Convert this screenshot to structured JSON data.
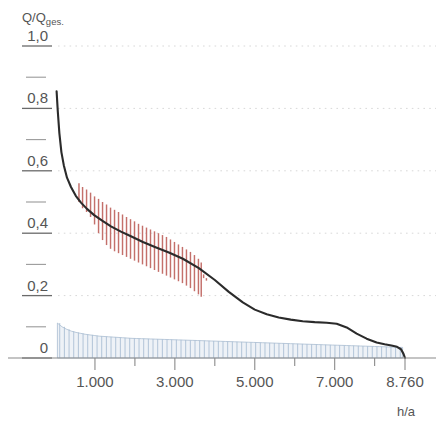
{
  "chart_data": {
    "type": "line",
    "title": "",
    "ylabel": "Q/Qges.",
    "ylabel_main": "Q/Q",
    "ylabel_sub": "ges.",
    "xlabel": "h/a",
    "xlim": [
      0,
      8760
    ],
    "ylim": [
      0,
      1.0
    ],
    "grid": "horizontal-dotted",
    "legend": "none",
    "y_ticks": [
      {
        "value": 1.0,
        "label": "1,0"
      },
      {
        "value": 0.9,
        "label": ""
      },
      {
        "value": 0.8,
        "label": "0,8"
      },
      {
        "value": 0.7,
        "label": ""
      },
      {
        "value": 0.6,
        "label": "0,6"
      },
      {
        "value": 0.5,
        "label": ""
      },
      {
        "value": 0.4,
        "label": "0,4"
      },
      {
        "value": 0.3,
        "label": ""
      },
      {
        "value": 0.2,
        "label": "0,2"
      },
      {
        "value": 0.1,
        "label": ""
      },
      {
        "value": 0.0,
        "label": "0"
      }
    ],
    "x_ticks": [
      {
        "value": 1000,
        "label": "1.000"
      },
      {
        "value": 2000,
        "label": ""
      },
      {
        "value": 3000,
        "label": "3.000"
      },
      {
        "value": 4000,
        "label": ""
      },
      {
        "value": 5000,
        "label": "5.000"
      },
      {
        "value": 6000,
        "label": ""
      },
      {
        "value": 7000,
        "label": ""
      },
      {
        "value": 8000,
        "label": ""
      },
      {
        "value": 8760,
        "label": "8.760"
      }
    ],
    "x_ticks_labeled": [
      "1.000",
      "3.000",
      "5.000",
      "7.000",
      "8.760"
    ],
    "series": [
      {
        "name": "duration-curve",
        "color": "#2b2b2b",
        "x": [
          40,
          70,
          110,
          160,
          220,
          300,
          400,
          520,
          650,
          800,
          980,
          1180,
          1400,
          1650,
          1900,
          2200,
          2500,
          2850,
          3200,
          3600,
          4000,
          4350,
          4700,
          5000,
          5300,
          5600,
          5900,
          6200,
          6500,
          6800,
          7050,
          7300,
          7550,
          7800,
          8050,
          8250,
          8420,
          8560,
          8660,
          8720,
          8760
        ],
        "y": [
          0.855,
          0.79,
          0.72,
          0.66,
          0.618,
          0.578,
          0.548,
          0.52,
          0.498,
          0.478,
          0.458,
          0.44,
          0.422,
          0.405,
          0.39,
          0.372,
          0.356,
          0.338,
          0.318,
          0.288,
          0.25,
          0.212,
          0.178,
          0.155,
          0.14,
          0.13,
          0.123,
          0.118,
          0.115,
          0.113,
          0.11,
          0.098,
          0.078,
          0.062,
          0.05,
          0.044,
          0.04,
          0.036,
          0.028,
          0.014,
          0.0
        ]
      }
    ],
    "error_bars": {
      "name": "measurement-spread",
      "color": "#c4706b",
      "x_start": 600,
      "x_end": 3700,
      "count": 34,
      "values": [
        {
          "x": 600,
          "low": 0.5,
          "high": 0.56
        },
        {
          "x": 690,
          "low": 0.48,
          "high": 0.548
        },
        {
          "x": 790,
          "low": 0.468,
          "high": 0.54
        },
        {
          "x": 890,
          "low": 0.452,
          "high": 0.53
        },
        {
          "x": 990,
          "low": 0.428,
          "high": 0.518
        },
        {
          "x": 1090,
          "low": 0.4,
          "high": 0.51
        },
        {
          "x": 1190,
          "low": 0.378,
          "high": 0.5
        },
        {
          "x": 1290,
          "low": 0.362,
          "high": 0.492
        },
        {
          "x": 1390,
          "low": 0.35,
          "high": 0.482
        },
        {
          "x": 1490,
          "low": 0.342,
          "high": 0.475
        },
        {
          "x": 1590,
          "low": 0.336,
          "high": 0.468
        },
        {
          "x": 1690,
          "low": 0.33,
          "high": 0.46
        },
        {
          "x": 1790,
          "low": 0.324,
          "high": 0.452
        },
        {
          "x": 1890,
          "low": 0.318,
          "high": 0.445
        },
        {
          "x": 1990,
          "low": 0.312,
          "high": 0.438
        },
        {
          "x": 2090,
          "low": 0.306,
          "high": 0.43
        },
        {
          "x": 2190,
          "low": 0.3,
          "high": 0.424
        },
        {
          "x": 2290,
          "low": 0.294,
          "high": 0.418
        },
        {
          "x": 2390,
          "low": 0.288,
          "high": 0.412
        },
        {
          "x": 2490,
          "low": 0.282,
          "high": 0.406
        },
        {
          "x": 2590,
          "low": 0.276,
          "high": 0.4
        },
        {
          "x": 2690,
          "low": 0.27,
          "high": 0.394
        },
        {
          "x": 2790,
          "low": 0.264,
          "high": 0.388
        },
        {
          "x": 2890,
          "low": 0.258,
          "high": 0.38
        },
        {
          "x": 2990,
          "low": 0.252,
          "high": 0.372
        },
        {
          "x": 3090,
          "low": 0.246,
          "high": 0.364
        },
        {
          "x": 3190,
          "low": 0.24,
          "high": 0.356
        },
        {
          "x": 3290,
          "low": 0.232,
          "high": 0.348
        },
        {
          "x": 3390,
          "low": 0.224,
          "high": 0.34
        },
        {
          "x": 3490,
          "low": 0.214,
          "high": 0.33
        },
        {
          "x": 3590,
          "low": 0.204,
          "high": 0.318
        },
        {
          "x": 3660,
          "low": 0.196,
          "high": 0.306
        },
        {
          "x": 3720,
          "low": 0.256,
          "high": 0.268
        },
        {
          "x": 3790,
          "low": 0.248,
          "high": 0.256
        }
      ]
    },
    "histogram": {
      "name": "frequency-bars",
      "color": "#aabed4",
      "x_start": 60,
      "x_end": 8700,
      "bar_count": 74,
      "envelope_y": [
        0.112,
        0.1,
        0.092,
        0.086,
        0.082,
        0.079,
        0.076,
        0.074,
        0.072,
        0.07,
        0.069,
        0.068,
        0.067,
        0.066,
        0.065,
        0.064,
        0.063,
        0.0625,
        0.062,
        0.0615,
        0.061,
        0.0605,
        0.06,
        0.0595,
        0.059,
        0.0585,
        0.058,
        0.0575,
        0.057,
        0.0565,
        0.056,
        0.0555,
        0.055,
        0.0545,
        0.054,
        0.0535,
        0.053,
        0.0525,
        0.052,
        0.0515,
        0.051,
        0.0505,
        0.05,
        0.0495,
        0.049,
        0.0485,
        0.048,
        0.0475,
        0.047,
        0.0465,
        0.046,
        0.0455,
        0.045,
        0.0445,
        0.044,
        0.0435,
        0.043,
        0.0425,
        0.042,
        0.0415,
        0.041,
        0.0405,
        0.04,
        0.0395,
        0.039,
        0.0385,
        0.038,
        0.0375,
        0.037,
        0.0365,
        0.036,
        0.0355,
        0.035,
        0.034
      ]
    }
  }
}
